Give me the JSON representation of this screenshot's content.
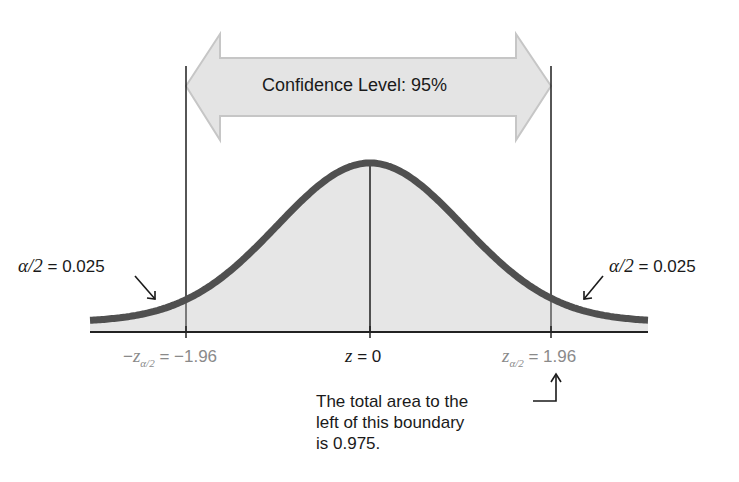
{
  "diagram": {
    "title": "Confidence Level: 95%",
    "confidence_level": "95%",
    "left_tail": {
      "label_symbol": "α/2",
      "label_eq": " = 0.025",
      "area": 0.025
    },
    "right_tail": {
      "label_symbol": "α/2",
      "label_eq": " = 0.025",
      "area": 0.025
    },
    "axis_labels": {
      "left": {
        "prefix": "−",
        "var": "z",
        "sub": "α/2",
        "value": " = −1.96"
      },
      "center": {
        "var": "z",
        "value": " = 0"
      },
      "right": {
        "var": "z",
        "sub": "α/2",
        "value": " = 1.96"
      }
    },
    "annotation": {
      "line1": "The total area to the",
      "line2": "left of this boundary",
      "line3": "is 0.975."
    },
    "colors": {
      "curve": "#505050",
      "fill": "#e6e6e6",
      "arrow_fill": "#e4e4e4",
      "arrow_stroke": "#c8c8c8",
      "axis": "#222222",
      "critical_label": "#8a8a8a"
    }
  },
  "chart_data": {
    "type": "area",
    "title": "Confidence Level: 95%",
    "distribution": "standard normal",
    "x": [
      -3.0,
      -1.96,
      0,
      1.96,
      3.0
    ],
    "critical_values": [
      -1.96,
      1.96
    ],
    "center": 0,
    "tail_areas": [
      0.025,
      0.025
    ],
    "cumulative_at_upper": 0.975,
    "xlabel": "z",
    "ylabel": "",
    "grid": false
  }
}
